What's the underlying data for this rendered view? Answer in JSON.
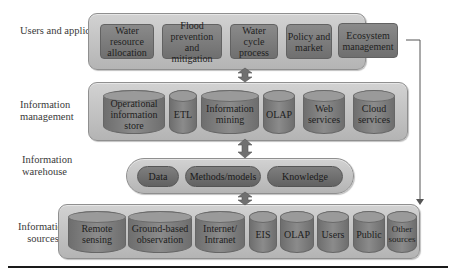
{
  "diagram": {
    "layers": {
      "users": {
        "label": "Users and applications",
        "items": [
          "Water resource allocation",
          "Flood prevention and mitigation",
          "Water cycle process",
          "Policy and market",
          "Ecosystem management"
        ]
      },
      "management": {
        "label": "Information management",
        "items": [
          "Operational information store",
          "ETL",
          "Information mining",
          "OLAP",
          "Web services",
          "Cloud services"
        ]
      },
      "warehouse": {
        "label": "Information warehouse",
        "items": [
          "Data",
          "Methods/models",
          "Knowledge"
        ]
      },
      "sources": {
        "label": "Information sources",
        "items": [
          "Remote sensing",
          "Ground-based observation",
          "Internet/ Intranet",
          "EIS",
          "OLAP",
          "Users",
          "Public",
          "Other sources"
        ]
      }
    },
    "colors": {
      "panel": "#c4c4c4",
      "box": "#7d7d7d",
      "arrow": "#6a6a6a",
      "connector": "#555555"
    }
  }
}
